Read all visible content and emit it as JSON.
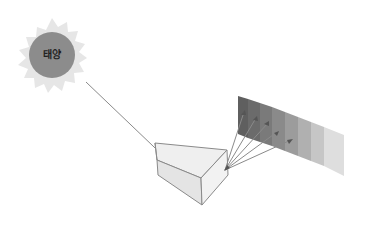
{
  "diagram": {
    "title": "",
    "sun": {
      "label": "태양",
      "fill": "#8c8c8c",
      "rays_fill": "#e6e6e6"
    },
    "prism": {
      "face_fill": "#ececec",
      "edge_color": "#8a8a8a"
    },
    "spectrum": {
      "band_count": 8,
      "colors": [
        "#5f5f5f",
        "#6e6e6e",
        "#7d7d7d",
        "#8e8e8e",
        "#a0a0a0",
        "#b4b4b4",
        "#c9c9c9",
        "#dedede"
      ]
    },
    "light_ray": {
      "color": "#8a8a8a"
    },
    "dispersed_rays_count": 5
  }
}
